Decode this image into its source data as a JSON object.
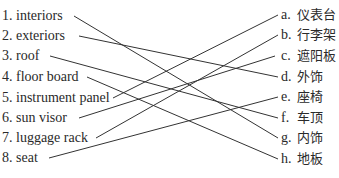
{
  "left_items": [
    {
      "num": "1.",
      "label": "interiors",
      "y": 8
    },
    {
      "num": "2.",
      "label": "exteriors",
      "y": 28
    },
    {
      "num": "3.",
      "label": "roof",
      "y": 48
    },
    {
      "num": "4.",
      "label": "floor board",
      "y": 69
    },
    {
      "num": "5.",
      "label": "instrument panel",
      "y": 90
    },
    {
      "num": "6.",
      "label": "sun visor",
      "y": 110
    },
    {
      "num": "7.",
      "label": "luggage rack",
      "y": 130
    },
    {
      "num": "8.",
      "label": "seat",
      "y": 150
    }
  ],
  "right_items": [
    {
      "letter": "a.",
      "label": "仪表台",
      "y": 7
    },
    {
      "letter": "b.",
      "label": "行李架",
      "y": 27
    },
    {
      "letter": "c.",
      "label": "遮阳板",
      "y": 48
    },
    {
      "letter": "d.",
      "label": "外饰",
      "y": 69
    },
    {
      "letter": "e.",
      "label": "座椅",
      "y": 89
    },
    {
      "letter": "f.",
      "label": "车顶",
      "y": 110
    },
    {
      "letter": "g.",
      "label": "内饰",
      "y": 130
    },
    {
      "letter": "h.",
      "label": "地板",
      "y": 151
    }
  ],
  "matches": [
    {
      "from": "1",
      "to": "g",
      "x1": 74,
      "y1": 16,
      "x2": 278,
      "y2": 138
    },
    {
      "from": "2",
      "to": "d",
      "x1": 79,
      "y1": 36,
      "x2": 278,
      "y2": 77
    },
    {
      "from": "3",
      "to": "f",
      "x1": 50,
      "y1": 56,
      "x2": 278,
      "y2": 118
    },
    {
      "from": "4",
      "to": "h",
      "x1": 87,
      "y1": 77,
      "x2": 278,
      "y2": 159
    },
    {
      "from": "5",
      "to": "a",
      "x1": 113,
      "y1": 98,
      "x2": 278,
      "y2": 15
    },
    {
      "from": "6",
      "to": "c",
      "x1": 79,
      "y1": 118,
      "x2": 275,
      "y2": 56
    },
    {
      "from": "7",
      "to": "b",
      "x1": 96,
      "y1": 138,
      "x2": 278,
      "y2": 35
    },
    {
      "from": "8",
      "to": "e",
      "x1": 49,
      "y1": 158,
      "x2": 278,
      "y2": 97
    }
  ],
  "line_color": "#333333"
}
